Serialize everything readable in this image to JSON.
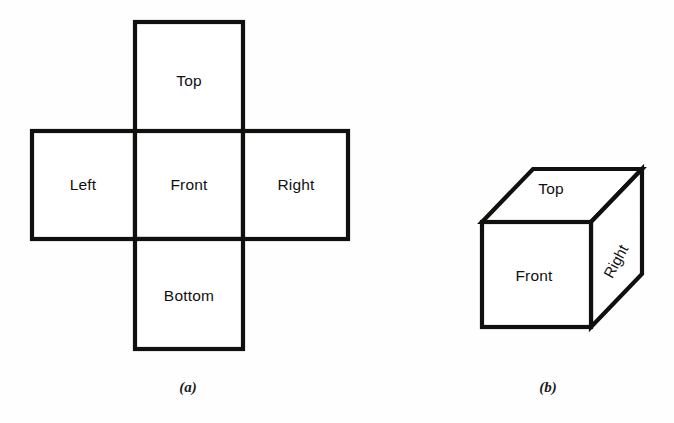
{
  "figure": {
    "background_color": "#fefefe",
    "stroke_color": "#10100f",
    "text_color": "#111111"
  },
  "panels": [
    {
      "id": "net",
      "caption": "(a)",
      "caption_x": 188,
      "caption_y": 389,
      "description": "Unfolded cube net, cross shaped, six faces",
      "faces": [
        {
          "name": "top",
          "label": "Top",
          "x": 135,
          "y": 22,
          "w": 108,
          "h": 110,
          "label_x": 189,
          "label_y": 82
        },
        {
          "name": "left",
          "label": "Left",
          "x": 32,
          "y": 131,
          "w": 103,
          "h": 108,
          "label_x": 83,
          "label_y": 186
        },
        {
          "name": "front",
          "label": "Front",
          "x": 135,
          "y": 131,
          "w": 108,
          "h": 108,
          "label_x": 189,
          "label_y": 186
        },
        {
          "name": "right",
          "label": "Right",
          "x": 243,
          "y": 131,
          "w": 105,
          "h": 108,
          "label_x": 296,
          "label_y": 186
        },
        {
          "name": "bottom",
          "label": "Bottom",
          "x": 135,
          "y": 239,
          "w": 108,
          "h": 110,
          "label_x": 189,
          "label_y": 297
        }
      ]
    },
    {
      "id": "cube",
      "caption": "(b)",
      "caption_x": 548,
      "caption_y": 389,
      "description": "Isometric cube showing three visible faces",
      "geometry": {
        "front_left": 482,
        "front_top": 222,
        "front_right": 591,
        "front_bottom": 327,
        "depth_dx": 51,
        "depth_dy": -53
      },
      "faces": [
        {
          "name": "top",
          "label": "Top",
          "label_x": 551,
          "label_y": 190,
          "rotation": 0
        },
        {
          "name": "front",
          "label": "Front",
          "label_x": 534,
          "label_y": 277,
          "rotation": 0
        },
        {
          "name": "right",
          "label": "Right",
          "label_x": 617,
          "label_y": 262,
          "rotation": -62
        }
      ]
    }
  ]
}
